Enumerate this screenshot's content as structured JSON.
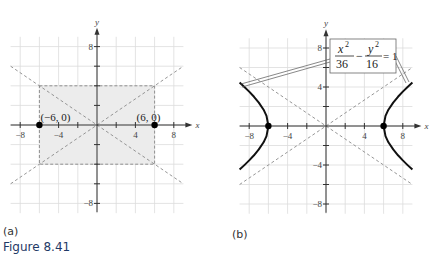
{
  "figure": {
    "caption": "Figure 8.41",
    "caption_color": "#1f3a66"
  },
  "panels": [
    {
      "label": "(a)",
      "axis_labels": {
        "x": "x",
        "y": "y"
      },
      "x_ticks": [
        "-8",
        "-4",
        "4",
        "8"
      ],
      "y_ticks": [
        "8",
        "-8"
      ],
      "points": [
        {
          "label": "(−6, 0)",
          "x": -6,
          "y": 0
        },
        {
          "label": "(6, 0)",
          "x": 6,
          "y": 0
        }
      ]
    },
    {
      "label": "(b)",
      "axis_labels": {
        "x": "x",
        "y": "y"
      },
      "x_ticks": [
        "-8",
        "-4",
        "4",
        "8"
      ],
      "y_ticks": [
        "8",
        "4",
        "-4",
        "-8"
      ],
      "equation": {
        "x_num": "x",
        "x_den": "36",
        "y_num": "y",
        "y_den": "16",
        "exp": "2",
        "minus": "−",
        "rhs": "= 1"
      }
    }
  ],
  "chart_data": [
    {
      "type": "line",
      "title": "(a)",
      "xlabel": "x",
      "ylabel": "y",
      "xlim": [
        -9,
        9
      ],
      "ylim": [
        -9,
        9
      ],
      "grid": true,
      "grid_step": 2,
      "x_ticks": [
        -8,
        -4,
        4,
        8
      ],
      "y_ticks": [
        8,
        -8
      ],
      "shaded_rectangle": {
        "x": [
          -6,
          6
        ],
        "y": [
          -4,
          4
        ],
        "style": "dashed border, light gray fill"
      },
      "asymptotes": [
        {
          "name": "y = (2/3)x",
          "x": [
            -9,
            9
          ],
          "y": [
            -6,
            6
          ],
          "style": "dashed"
        },
        {
          "name": "y = -(2/3)x",
          "x": [
            -9,
            9
          ],
          "y": [
            6,
            -6
          ],
          "style": "dashed"
        }
      ],
      "points": [
        {
          "x": -6,
          "y": 0,
          "label": "(−6, 0)"
        },
        {
          "x": 6,
          "y": 0,
          "label": "(6, 0)"
        }
      ]
    },
    {
      "type": "line",
      "title": "(b)",
      "xlabel": "x",
      "ylabel": "y",
      "xlim": [
        -9,
        9
      ],
      "ylim": [
        -9,
        9
      ],
      "grid": true,
      "grid_step": 2,
      "x_ticks": [
        -8,
        -4,
        4,
        8
      ],
      "y_ticks": [
        8,
        4,
        -4,
        -8
      ],
      "equation": "x^2/36 - y^2/16 = 1",
      "series": [
        {
          "name": "right branch",
          "x": [
            9,
            8.5,
            8,
            7.5,
            7,
            6.5,
            6.2,
            6,
            6.2,
            6.5,
            7,
            7.5,
            8,
            8.5,
            9
          ],
          "y": [
            4.47,
            4.01,
            3.53,
            3.0,
            2.4,
            1.67,
            1.04,
            0,
            -1.04,
            -1.67,
            -2.4,
            -3.0,
            -3.53,
            -4.01,
            -4.47
          ]
        },
        {
          "name": "left branch",
          "x": [
            -9,
            -8.5,
            -8,
            -7.5,
            -7,
            -6.5,
            -6.2,
            -6,
            -6.2,
            -6.5,
            -7,
            -7.5,
            -8,
            -8.5,
            -9
          ],
          "y": [
            4.47,
            4.01,
            3.53,
            3.0,
            2.4,
            1.67,
            1.04,
            0,
            -1.04,
            -1.67,
            -2.4,
            -3.0,
            -3.53,
            -4.01,
            -4.47
          ]
        }
      ],
      "asymptotes": [
        {
          "name": "y = (2/3)x",
          "x": [
            -9,
            9
          ],
          "y": [
            -6,
            6
          ],
          "style": "dashed"
        },
        {
          "name": "y = -(2/3)x",
          "x": [
            -9,
            9
          ],
          "y": [
            6,
            -6
          ],
          "style": "dashed"
        }
      ],
      "points": [
        {
          "x": -6,
          "y": 0
        },
        {
          "x": 6,
          "y": 0
        }
      ]
    }
  ]
}
